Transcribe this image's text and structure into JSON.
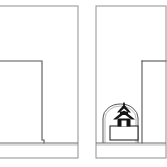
{
  "figure": {
    "background_color": "#ffffff",
    "width": 167,
    "height": 167,
    "line_color": "#555555",
    "frame_color": "#8f8f8f",
    "fill_color": "#141414",
    "panel_count": 2
  },
  "panels": [
    {
      "id": "panel-left",
      "label": "Left section without shrine",
      "frame": {
        "x": -6,
        "y": 6,
        "width": 84,
        "height": 152
      },
      "ground_line": {
        "x1": -6,
        "y": 143,
        "x2": 78
      },
      "outline_points": "-6,61 42,61 42,140 44,140 44,143",
      "has_shrine": "false",
      "has_arch": "false"
    },
    {
      "id": "panel-right",
      "label": "Right section with shrine in arched niche",
      "frame": {
        "x": 96,
        "y": 6,
        "width": 70,
        "height": 152
      },
      "ground_line": {
        "x1": 96,
        "y": 143,
        "x2": 166
      },
      "outline_points": "142,61 166,61",
      "wall_line": {
        "x": 142,
        "y1": 61,
        "y2": 143
      },
      "has_shrine": "true",
      "has_arch": "true",
      "arch": {
        "left_leg_x": 103,
        "right_leg_x": 138,
        "spring_y": 118,
        "crown_y": 104,
        "base_y": 143
      },
      "plinth": {
        "x": 110,
        "y": 126,
        "width": 28,
        "height": 14
      },
      "shrine": {
        "name": "pagoda-shrine",
        "base_x": 113,
        "base_y": 126,
        "width": 22,
        "height": 22,
        "roof_tiers": 2,
        "finial": "true",
        "door_opening": "true"
      }
    }
  ],
  "annotations": {
    "drawing_type": "architectural section",
    "units": "none shown",
    "scale_text": "",
    "caption": ""
  }
}
